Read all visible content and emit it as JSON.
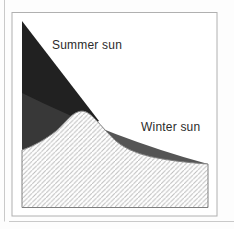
{
  "figure": {
    "labels": {
      "summer_sun": "Summer sun",
      "winter_sun": "Winter sun"
    },
    "colors": {
      "summer_beam": "#212121",
      "winter_beam": "rgba(60,60,60,0.87)",
      "hatch_line": "#bcbcbc",
      "terrain_outline": "#7f7f7f",
      "terrain_fill": "#ffffff",
      "box_border": "#b0b0b0",
      "box_fill": "#ffffff",
      "page_frame_line": "#c9c9c9",
      "label_text": "#2b2b2b"
    },
    "shapes": {
      "summer_beam": "sun-ray-wedge-steep",
      "winter_beam": "sun-ray-wedge-shallow",
      "terrain": "hatched-hill-profile"
    }
  }
}
